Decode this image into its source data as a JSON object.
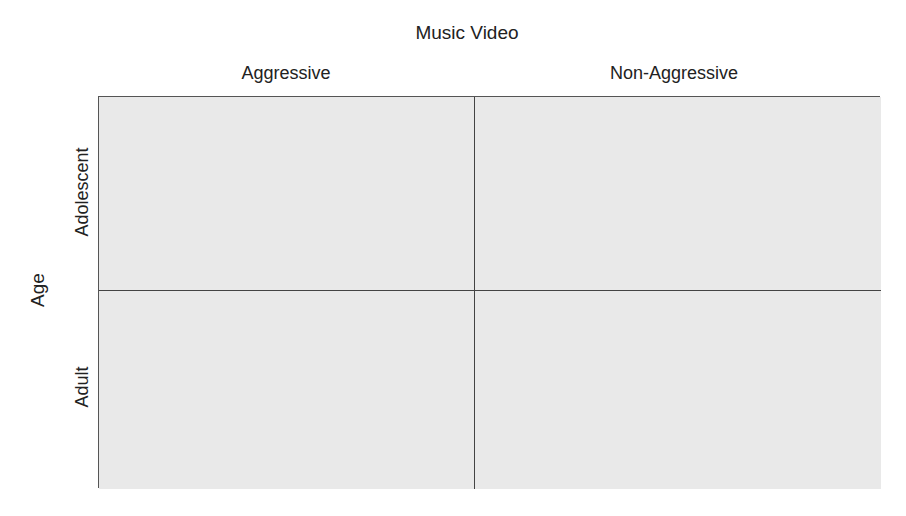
{
  "diagram": {
    "title": "Music Video",
    "column_factor": "Music Video",
    "columns": [
      "Aggressive",
      "Non-Aggressive"
    ],
    "row_factor": "Age",
    "rows": [
      "Adolescent",
      "Adult"
    ],
    "cells": [
      [
        "",
        ""
      ],
      [
        "",
        ""
      ]
    ],
    "colors": {
      "cell_fill": "#e9e9e9",
      "border": "#555555",
      "text": "#222222"
    }
  }
}
